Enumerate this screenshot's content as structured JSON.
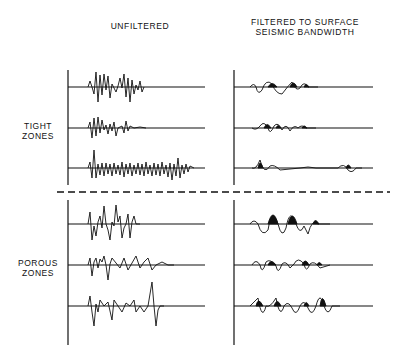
{
  "headers": {
    "unfiltered": "UNFILTERED",
    "filtered_line1": "FILTERED TO SURFACE",
    "filtered_line2": "SEISMIC BANDWIDTH"
  },
  "zones": {
    "tight_line1": "TIGHT",
    "tight_line2": "ZONES",
    "porous_line1": "POROUS",
    "porous_line2": "ZONES"
  },
  "colors": {
    "ink": "#111111",
    "background": "#ffffff"
  },
  "layout": {
    "left_axis_x": 68,
    "right_axis_x": 234,
    "separator_y": 192,
    "tight_baselines_y": [
      87,
      128,
      168
    ],
    "porous_baselines_y": [
      224,
      265,
      306
    ]
  }
}
